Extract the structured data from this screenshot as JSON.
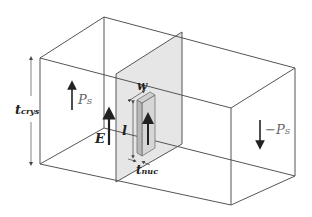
{
  "diagram": {
    "colors": {
      "edge": "#555555",
      "wall_fill": "#e6e6e6",
      "nucleus_front": "#b8b8b8",
      "nucleus_side": "#d6d6d6",
      "nucleus_top": "#cfcfcf",
      "arrow": "#222222"
    },
    "labels": {
      "crystal_thickness": {
        "main": "t",
        "sub": "crys"
      },
      "left_polarization": {
        "main": "P",
        "sub": "S"
      },
      "right_polarization": {
        "main": "−P",
        "sub": "S"
      },
      "field": {
        "main": "E"
      },
      "nucleus_width": {
        "main": "w"
      },
      "nucleus_length": {
        "main": "l"
      },
      "nucleus_thickness": {
        "main": "t",
        "sub": "nuc"
      }
    }
  }
}
